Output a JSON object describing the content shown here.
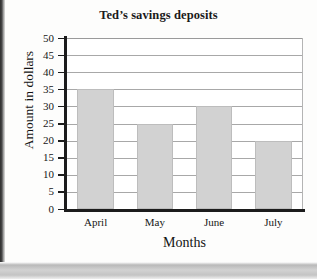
{
  "chart_data": {
    "type": "bar",
    "title": "Ted’s savings deposits",
    "xlabel": "Months",
    "ylabel": "Amount in dollars",
    "categories": [
      "April",
      "May",
      "June",
      "July"
    ],
    "values": [
      35,
      25,
      30,
      20
    ],
    "ylim": [
      0,
      50
    ],
    "ytick_step": 5,
    "yticks": [
      50,
      45,
      40,
      35,
      30,
      25,
      20,
      15,
      10,
      5,
      0
    ],
    "grid": true,
    "legend": "none",
    "bar_color": "#d2d2d2",
    "bar_border_color": "#bdbdbd",
    "axis_color": "#1c1c1c",
    "gridline_color": "#a8a8a8"
  }
}
